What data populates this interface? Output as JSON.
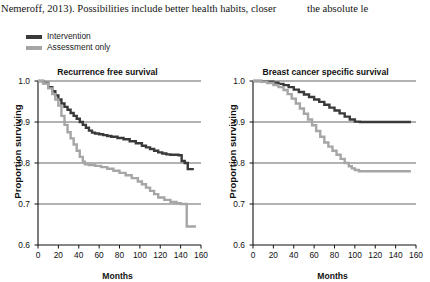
{
  "body_text": {
    "column_left": "Nemeroff, 2013). Possibilities include better health habits, closer",
    "column_right": "the absolute le"
  },
  "legend": {
    "position": "above-left",
    "items": [
      {
        "label": "Intervention",
        "color": "#3a3a3a",
        "key": "intervention"
      },
      {
        "label": "Assessment only",
        "color": "#a6a6a6",
        "key": "assessment_only"
      }
    ]
  },
  "colors": {
    "intervention": "#3a3a3a",
    "assessment_only": "#a6a6a6",
    "axis": "#111111",
    "grid": "#222222"
  },
  "chart_data": [
    {
      "type": "line",
      "panel": "left",
      "title": "Recurrence free survival",
      "xlabel": "Months",
      "ylabel": "Proportion surviving",
      "xlim": [
        0,
        160
      ],
      "ylim": [
        0.6,
        1.0
      ],
      "xticks": [
        0,
        20,
        40,
        60,
        80,
        100,
        120,
        140,
        160
      ],
      "yticks": [
        0.6,
        0.7,
        0.8,
        0.9,
        1.0
      ],
      "xtick_labels": [
        "0",
        "20",
        "40",
        "60",
        "80",
        "100",
        "120",
        "140",
        "160"
      ],
      "ytick_labels": [
        "0.6",
        "0.7",
        "0.8",
        "0.9",
        "1.0"
      ],
      "grid": "horizontal",
      "legend": [
        "Intervention",
        "Assessment only"
      ],
      "series": [
        {
          "name": "Intervention",
          "color": "#3a3a3a",
          "step": true,
          "x": [
            0,
            5,
            10,
            14,
            17,
            20,
            23,
            26,
            29,
            32,
            35,
            38,
            41,
            44,
            47,
            50,
            53,
            56,
            60,
            64,
            68,
            72,
            78,
            84,
            90,
            96,
            102,
            106,
            110,
            114,
            118,
            122,
            126,
            130,
            134,
            138,
            141,
            144,
            147,
            153
          ],
          "y": [
            1.0,
            0.995,
            0.985,
            0.975,
            0.965,
            0.955,
            0.945,
            0.937,
            0.93,
            0.922,
            0.915,
            0.908,
            0.9,
            0.893,
            0.886,
            0.879,
            0.874,
            0.872,
            0.87,
            0.868,
            0.866,
            0.864,
            0.861,
            0.858,
            0.853,
            0.848,
            0.842,
            0.838,
            0.834,
            0.83,
            0.826,
            0.823,
            0.821,
            0.82,
            0.82,
            0.819,
            0.805,
            0.8,
            0.785,
            0.785
          ]
        },
        {
          "name": "Assessment only",
          "color": "#a6a6a6",
          "step": true,
          "x": [
            0,
            5,
            10,
            14,
            17,
            20,
            23,
            26,
            29,
            32,
            35,
            38,
            41,
            44,
            46,
            50,
            56,
            62,
            68,
            74,
            80,
            86,
            92,
            98,
            102,
            106,
            110,
            114,
            118,
            124,
            130,
            136,
            140,
            143,
            146,
            155
          ],
          "y": [
            1.0,
            0.994,
            0.982,
            0.968,
            0.955,
            0.94,
            0.915,
            0.893,
            0.875,
            0.86,
            0.845,
            0.83,
            0.815,
            0.803,
            0.797,
            0.795,
            0.793,
            0.79,
            0.786,
            0.781,
            0.776,
            0.77,
            0.763,
            0.755,
            0.748,
            0.74,
            0.732,
            0.724,
            0.716,
            0.71,
            0.705,
            0.702,
            0.7,
            0.7,
            0.645,
            0.645
          ]
        }
      ]
    },
    {
      "type": "line",
      "panel": "right",
      "title": "Breast cancer specific survival",
      "xlabel": "Months",
      "ylabel": "Proportion surviving",
      "xlim": [
        0,
        160
      ],
      "ylim": [
        0.6,
        1.0
      ],
      "xticks": [
        0,
        20,
        40,
        60,
        80,
        100,
        120,
        140,
        160
      ],
      "yticks": [
        0.6,
        0.7,
        0.8,
        0.9,
        1.0
      ],
      "xtick_labels": [
        "0",
        "20",
        "40",
        "60",
        "80",
        "100",
        "120",
        "140",
        "160"
      ],
      "ytick_labels": [
        "0.6",
        "0.7",
        "0.8",
        "0.9",
        "1.0"
      ],
      "grid": "horizontal",
      "legend": [
        "Intervention",
        "Assessment only"
      ],
      "series": [
        {
          "name": "Intervention",
          "color": "#3a3a3a",
          "step": true,
          "x": [
            0,
            8,
            14,
            20,
            25,
            30,
            35,
            40,
            45,
            50,
            55,
            60,
            65,
            70,
            75,
            80,
            85,
            90,
            95,
            100,
            105,
            110,
            120,
            130,
            140,
            150,
            155
          ],
          "y": [
            1.0,
            0.999,
            0.998,
            0.996,
            0.993,
            0.99,
            0.985,
            0.979,
            0.973,
            0.967,
            0.961,
            0.955,
            0.949,
            0.942,
            0.935,
            0.928,
            0.921,
            0.913,
            0.906,
            0.901,
            0.9,
            0.9,
            0.9,
            0.9,
            0.9,
            0.9,
            0.9
          ]
        },
        {
          "name": "Assessment only",
          "color": "#a6a6a6",
          "step": true,
          "x": [
            0,
            8,
            14,
            20,
            25,
            30,
            34,
            38,
            42,
            46,
            50,
            54,
            58,
            62,
            66,
            70,
            74,
            78,
            82,
            86,
            90,
            94,
            97,
            100,
            104,
            110,
            120,
            130,
            140,
            150,
            155
          ],
          "y": [
            1.0,
            0.998,
            0.995,
            0.99,
            0.985,
            0.978,
            0.968,
            0.957,
            0.945,
            0.933,
            0.92,
            0.906,
            0.892,
            0.878,
            0.864,
            0.85,
            0.84,
            0.83,
            0.82,
            0.81,
            0.8,
            0.792,
            0.787,
            0.783,
            0.78,
            0.78,
            0.78,
            0.78,
            0.78,
            0.78,
            0.78
          ]
        }
      ]
    }
  ]
}
